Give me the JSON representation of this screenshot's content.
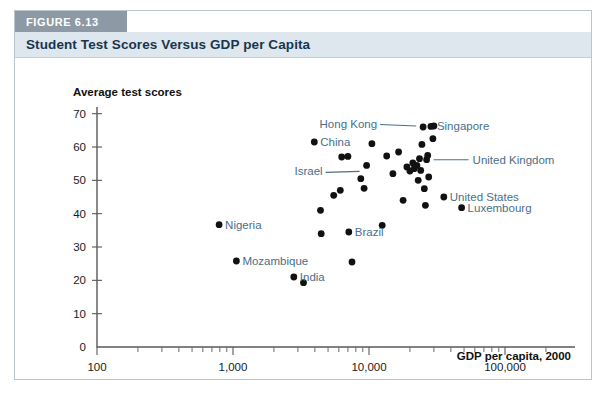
{
  "figure": {
    "badge": "FIGURE 6.13",
    "title": "Student Test Scores Versus GDP per Capita"
  },
  "chart_data": {
    "type": "scatter",
    "title": "Student Test Scores Versus GDP per Capita",
    "xlabel": "GDP per capita, 2000",
    "ylabel": "Average test scores",
    "xscale": "log",
    "xlim": [
      100,
      200000
    ],
    "ylim": [
      0,
      72
    ],
    "grid": false,
    "legend": false,
    "xticks": [
      "100",
      "1,000",
      "10,000",
      "100,000"
    ],
    "xtick_values": [
      100,
      1000,
      10000,
      100000
    ],
    "yticks": [
      "0",
      "10",
      "20",
      "30",
      "40",
      "50",
      "60",
      "70"
    ],
    "ytick_values": [
      0,
      10,
      20,
      30,
      40,
      50,
      60,
      70
    ],
    "points": [
      {
        "label": "Nigeria",
        "x": 790,
        "y": 36.7,
        "label_pos": "right"
      },
      {
        "label": "Mozambique",
        "x": 1060,
        "y": 25.8,
        "label_pos": "right"
      },
      {
        "label": "India",
        "x": 2800,
        "y": 21.0,
        "label_pos": "right"
      },
      {
        "label": "China",
        "x": 3960,
        "y": 61.5,
        "label_pos": "right"
      },
      {
        "label": "Brazil",
        "x": 7100,
        "y": 34.5,
        "label_pos": "right"
      },
      {
        "label": "Israel",
        "x": 9600,
        "y": 54.5,
        "label_pos": "leader-left"
      },
      {
        "label": "Hong Kong",
        "x": 25000,
        "y": 66.0,
        "label_pos": "leader-left"
      },
      {
        "label": "Singapore",
        "x": 28500,
        "y": 66.2,
        "label_pos": "right"
      },
      {
        "label": "United Kingdom",
        "x": 26500,
        "y": 56.2,
        "label_pos": "leader-right"
      },
      {
        "label": "United States",
        "x": 35500,
        "y": 45.0,
        "label_pos": "right"
      },
      {
        "label": "Luxembourg",
        "x": 48000,
        "y": 41.8,
        "label_pos": "right"
      },
      {
        "label": "",
        "x": 3300,
        "y": 19.3
      },
      {
        "label": "",
        "x": 4400,
        "y": 41.0
      },
      {
        "label": "",
        "x": 4450,
        "y": 34.0
      },
      {
        "label": "",
        "x": 5500,
        "y": 45.5
      },
      {
        "label": "",
        "x": 6150,
        "y": 47.0
      },
      {
        "label": "",
        "x": 6300,
        "y": 57.0
      },
      {
        "label": "",
        "x": 7000,
        "y": 57.2
      },
      {
        "label": "",
        "x": 7500,
        "y": 25.5
      },
      {
        "label": "",
        "x": 8700,
        "y": 50.5
      },
      {
        "label": "",
        "x": 9200,
        "y": 47.6
      },
      {
        "label": "",
        "x": 10500,
        "y": 61.0
      },
      {
        "label": "",
        "x": 12500,
        "y": 36.5
      },
      {
        "label": "",
        "x": 13500,
        "y": 57.3
      },
      {
        "label": "",
        "x": 15000,
        "y": 52.0
      },
      {
        "label": "",
        "x": 16500,
        "y": 58.5
      },
      {
        "label": "",
        "x": 17800,
        "y": 44.0
      },
      {
        "label": "",
        "x": 19000,
        "y": 54.0
      },
      {
        "label": "",
        "x": 20000,
        "y": 52.8
      },
      {
        "label": "",
        "x": 21000,
        "y": 55.2
      },
      {
        "label": "",
        "x": 21500,
        "y": 53.5
      },
      {
        "label": "",
        "x": 22500,
        "y": 54.5
      },
      {
        "label": "",
        "x": 23000,
        "y": 50.0
      },
      {
        "label": "",
        "x": 23500,
        "y": 56.5
      },
      {
        "label": "",
        "x": 24000,
        "y": 53.0
      },
      {
        "label": "",
        "x": 24500,
        "y": 60.8
      },
      {
        "label": "",
        "x": 25500,
        "y": 47.5
      },
      {
        "label": "",
        "x": 26000,
        "y": 42.5
      },
      {
        "label": "",
        "x": 27000,
        "y": 57.5
      },
      {
        "label": "",
        "x": 27500,
        "y": 51.0
      },
      {
        "label": "",
        "x": 29500,
        "y": 62.5
      },
      {
        "label": "",
        "x": 30000,
        "y": 66.3
      }
    ]
  }
}
